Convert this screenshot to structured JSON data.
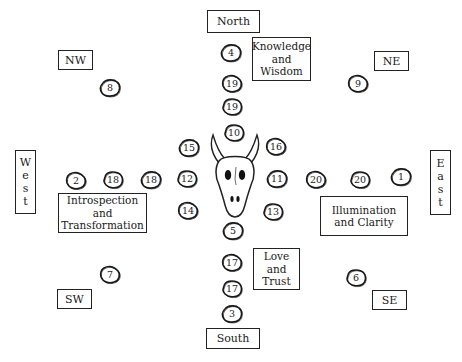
{
  "directions": {
    "north": "North",
    "south": "South",
    "east": [
      "E",
      "a",
      "s",
      "t"
    ],
    "west": [
      "W",
      "e",
      "s",
      "t"
    ],
    "nw": "NW",
    "ne": "NE",
    "sw": "SW",
    "se": "SE"
  },
  "themes": {
    "north": [
      "Knowledge",
      "and",
      "Wisdom"
    ],
    "west": [
      "Introspection",
      "and",
      "Transformation"
    ],
    "east": [
      "Illumination",
      "and Clarity"
    ],
    "south": [
      "Love",
      "and",
      "Trust"
    ]
  },
  "center": {
    "icon": "buffalo-skull-icon"
  },
  "stones": [
    {
      "id": "north-1",
      "label": "4",
      "x": 221,
      "y": 44
    },
    {
      "id": "north-2",
      "label": "19",
      "x": 222,
      "y": 75
    },
    {
      "id": "north-3",
      "label": "19",
      "x": 222,
      "y": 98
    },
    {
      "id": "nw",
      "label": "8",
      "x": 100,
      "y": 79
    },
    {
      "id": "ne",
      "label": "9",
      "x": 348,
      "y": 75
    },
    {
      "id": "inner-n",
      "label": "10",
      "x": 224,
      "y": 124
    },
    {
      "id": "inner-nw",
      "label": "15",
      "x": 179,
      "y": 139
    },
    {
      "id": "inner-ne",
      "label": "16",
      "x": 266,
      "y": 138
    },
    {
      "id": "inner-w",
      "label": "12",
      "x": 177,
      "y": 170
    },
    {
      "id": "inner-e",
      "label": "11",
      "x": 267,
      "y": 170
    },
    {
      "id": "inner-sw",
      "label": "14",
      "x": 178,
      "y": 202
    },
    {
      "id": "inner-se",
      "label": "13",
      "x": 263,
      "y": 203
    },
    {
      "id": "inner-s",
      "label": "5",
      "x": 223,
      "y": 222
    },
    {
      "id": "west-1",
      "label": "2",
      "x": 66,
      "y": 172
    },
    {
      "id": "west-2",
      "label": "18",
      "x": 103,
      "y": 171
    },
    {
      "id": "west-3",
      "label": "18",
      "x": 141,
      "y": 171
    },
    {
      "id": "east-1",
      "label": "20",
      "x": 306,
      "y": 171
    },
    {
      "id": "east-2",
      "label": "20",
      "x": 350,
      "y": 171
    },
    {
      "id": "east-3",
      "label": "1",
      "x": 391,
      "y": 168
    },
    {
      "id": "south-1",
      "label": "17",
      "x": 222,
      "y": 254
    },
    {
      "id": "south-2",
      "label": "17",
      "x": 222,
      "y": 280
    },
    {
      "id": "south-3",
      "label": "3",
      "x": 222,
      "y": 305
    },
    {
      "id": "sw",
      "label": "7",
      "x": 100,
      "y": 266
    },
    {
      "id": "se",
      "label": "6",
      "x": 346,
      "y": 269
    }
  ]
}
